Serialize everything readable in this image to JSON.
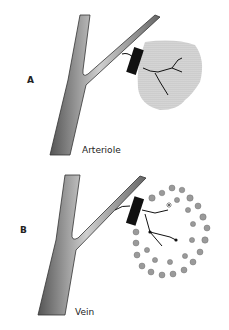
{
  "panels": [
    {
      "id": "A",
      "letter": "A",
      "caption": "Arteriole"
    },
    {
      "id": "B",
      "letter": "B",
      "caption": "Vein"
    }
  ],
  "colors": {
    "vessel_fill": "#8a8a8a",
    "vessel_highlight": "#d8d8d8",
    "vessel_edge": "#333333",
    "block": "#111111",
    "tissue_fill": "#c8c8c8",
    "cell_fill": "#9a9a9a"
  }
}
